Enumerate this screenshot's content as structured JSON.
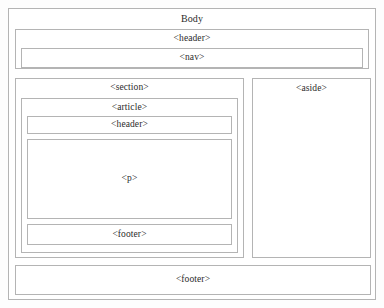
{
  "diagram": {
    "title": "Body",
    "type": "html5-semantic-layout",
    "body": {
      "label": "Body",
      "header": {
        "label": "<header>",
        "nav": {
          "label": "<nav>"
        }
      },
      "section": {
        "label": "<section>",
        "article": {
          "label": "<article>",
          "header": {
            "label": "<header>"
          },
          "paragraph": {
            "label": "<p>"
          },
          "footer": {
            "label": "<footer>"
          }
        }
      },
      "aside": {
        "label": "<aside>"
      },
      "footer": {
        "label": "<footer>"
      }
    },
    "colors": {
      "border": "#b4b4b4",
      "text": "#2b2b2b",
      "background": "#fdfdfd",
      "box_fill": "#ffffff"
    }
  }
}
